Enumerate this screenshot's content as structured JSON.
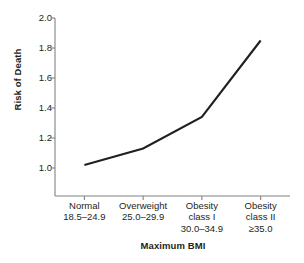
{
  "chart_data": {
    "type": "line",
    "title": "",
    "xlabel": "Maximum BMI",
    "ylabel": "Risk of Death",
    "categories": [
      "Normal\n18.5–24.9",
      "Overweight\n25.0–29.9",
      "Obesity class I\n30.0–34.9",
      "Obesity class II\n≥35.0"
    ],
    "category_lines": [
      [
        "Normal",
        "18.5–24.9"
      ],
      [
        "Overweight",
        "25.0–29.9"
      ],
      [
        "Obesity",
        "class I",
        "30.0–34.9"
      ],
      [
        "Obesity",
        "class II",
        "≥35.0"
      ]
    ],
    "values": [
      1.02,
      1.13,
      1.34,
      1.85
    ],
    "ylim": [
      0.85,
      2.0
    ],
    "yticks": [
      "1.0",
      "1.2",
      "1.4",
      "1.6",
      "1.8",
      "2.0"
    ],
    "ytick_values": [
      1.0,
      1.2,
      1.4,
      1.6,
      1.8,
      2.0
    ],
    "grid": false,
    "legend": "none",
    "line_color": "#231f20",
    "axis_color": "#808285",
    "background": "#ffffff"
  },
  "axis": {
    "y_title": "Risk of Death",
    "x_title": "Maximum BMI"
  }
}
